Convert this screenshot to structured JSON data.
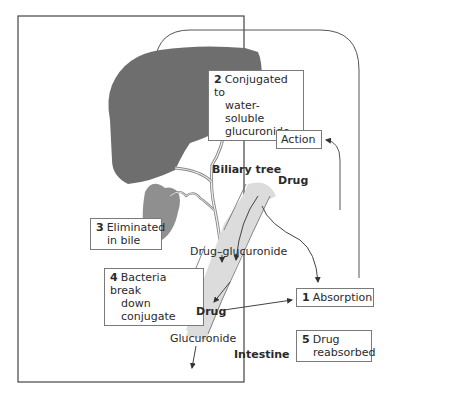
{
  "figure": {
    "colors": {
      "liver": "#6e6e6e",
      "gallbladder": "#8f8f8f",
      "intestine": "#dcdcdc",
      "frame": "#444444",
      "box_border": "#7a7a7a",
      "line": "#555555"
    }
  },
  "labels": {
    "biliary_tree": "Biliary tree",
    "drug_top": "Drug",
    "drug_glucuronide": "Drug–glucuronide",
    "drug_bottom": "Drug",
    "glucuronide": "Glucuronide",
    "intestine": "Intestine"
  },
  "boxes": {
    "step2": {
      "num": "2",
      "line1": "Conjugated to",
      "line2": "water-soluble",
      "line3": "glucuronide"
    },
    "action": {
      "text": "Action"
    },
    "step3": {
      "num": "3",
      "line1": "Eliminated",
      "line2": "in bile"
    },
    "step4": {
      "num": "4",
      "line1": "Bacteria break",
      "line2": "down conjugate"
    },
    "step1": {
      "num": "1",
      "line1": "Absorption"
    },
    "step5": {
      "num": "5",
      "line1": "Drug",
      "line2": "reabsorbed"
    }
  }
}
